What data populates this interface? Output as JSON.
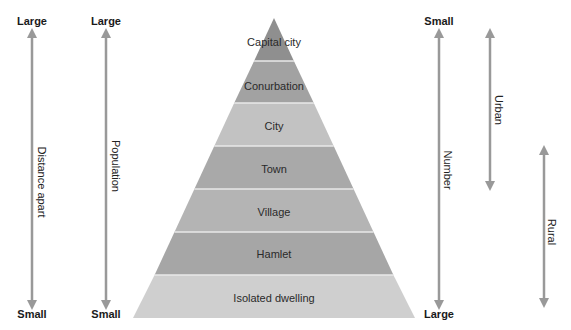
{
  "diagram": {
    "type": "settlement-hierarchy-pyramid",
    "tiers": [
      {
        "label": "Capital city",
        "color": "#8f8f8f"
      },
      {
        "label": "Conurbation",
        "color": "#a2a2a2"
      },
      {
        "label": "City",
        "color": "#c2c2c2"
      },
      {
        "label": "Town",
        "color": "#a9a9a9"
      },
      {
        "label": "Village",
        "color": "#b4b4b4"
      },
      {
        "label": "Hamlet",
        "color": "#a6a6a6"
      },
      {
        "label": "Isolated dwelling",
        "color": "#cfcfcf"
      }
    ],
    "left_axes": [
      {
        "label": "Distance apart",
        "top": "Large",
        "bottom": "Small"
      },
      {
        "label": "Population",
        "top": "Large",
        "bottom": "Small"
      }
    ],
    "right_axes": [
      {
        "label": "Number",
        "top": "Small",
        "bottom": "Large"
      },
      {
        "label": "Urban"
      },
      {
        "label": "Rural"
      }
    ],
    "colors": {
      "arrow": "#999999",
      "separator": "#e8e8e8",
      "text": "#1a1a1a"
    }
  }
}
